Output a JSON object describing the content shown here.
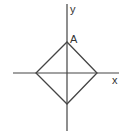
{
  "diagram": {
    "type": "coordinate-diagram",
    "axes": {
      "x_label": "x",
      "y_label": "y"
    },
    "shape": {
      "kind": "square rotated 45° (diamond) centered at origin",
      "vertex_labels": {
        "top": "A"
      }
    },
    "colors": {
      "line": "#444444",
      "background": "#ffffff"
    }
  }
}
